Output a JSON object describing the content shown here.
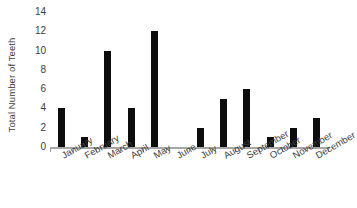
{
  "chart_data": {
    "type": "bar",
    "title": "",
    "xlabel": "",
    "ylabel": "Total Number of Teeth",
    "categories": [
      "January",
      "February",
      "March",
      "April",
      "May",
      "June",
      "July",
      "August",
      "September",
      "October",
      "November",
      "December"
    ],
    "values": [
      4,
      1,
      10,
      4,
      12,
      0,
      2,
      5,
      6,
      1,
      2,
      3
    ],
    "ylim": [
      0,
      14
    ],
    "yticks": [
      0,
      2,
      4,
      6,
      8,
      10,
      12,
      14
    ],
    "ytick_labels": [
      "0",
      "2",
      "4",
      "6",
      "8",
      "10",
      "12",
      "14"
    ],
    "grid": false,
    "legend": false,
    "bar_color": "#0d0d0d",
    "axis_color": "#a6a6a6",
    "text_color": "#3d3d3d",
    "background_color": "#ffffff",
    "xtick_label_rotation": -30
  }
}
